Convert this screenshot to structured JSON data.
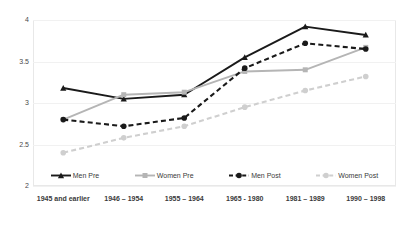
{
  "chart_data": {
    "type": "line",
    "title": "",
    "subtitle": "",
    "xlabel": "",
    "ylabel": "",
    "ylim": [
      2,
      4
    ],
    "yticks": [
      "2",
      "2.5",
      "3",
      "3.5",
      "4"
    ],
    "grid": true,
    "legend_position": "bottom",
    "categories": [
      "1945 and earlier",
      "1946 – 1954",
      "1955 – 1964",
      "1965 - 1980",
      "1981 – 1989",
      "1990 – 1998"
    ],
    "series": [
      {
        "name": "Men Pre",
        "color": "#1a1a1a",
        "style": "solid",
        "marker": "triangle",
        "values": [
          3.18,
          3.05,
          3.1,
          3.55,
          3.92,
          3.82
        ]
      },
      {
        "name": "Women Pre",
        "color": "#b5b5b5",
        "style": "solid",
        "marker": "square",
        "values": [
          2.8,
          3.1,
          3.13,
          3.38,
          3.4,
          3.67
        ]
      },
      {
        "name": "Men Post",
        "color": "#1a1a1a",
        "style": "dashed",
        "marker": "circle",
        "values": [
          2.8,
          2.72,
          2.82,
          3.42,
          3.72,
          3.65
        ]
      },
      {
        "name": "Women Post",
        "color": "#cfcfcf",
        "style": "dashed",
        "marker": "circle",
        "values": [
          2.4,
          2.58,
          2.72,
          2.95,
          3.15,
          3.32
        ]
      }
    ]
  },
  "legend": {
    "items": [
      {
        "label": "Men Pre"
      },
      {
        "label": "Women Pre"
      },
      {
        "label": "Men Post"
      },
      {
        "label": "Women Post"
      }
    ]
  }
}
